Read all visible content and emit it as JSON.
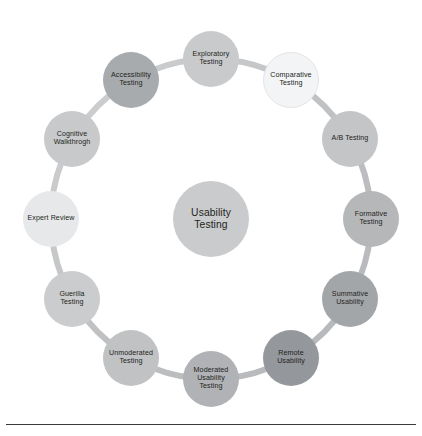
{
  "diagram": {
    "type": "circular-hub-and-spoke",
    "hub": {
      "label": "Usability\nTesting",
      "text": "Usability Testing",
      "color": "#c9cbcd",
      "cx": 211,
      "cy": 219,
      "r": 38
    },
    "ring": {
      "color": "#c4c6c8",
      "stroke_width": 6,
      "cx": 211,
      "cy": 219,
      "r": 160
    },
    "nodes": [
      {
        "id": "exploratory-testing",
        "label": "Exploratory\nTesting",
        "text": "Exploratory Testing",
        "color": "#c8cacc",
        "angle_deg": -90,
        "cx": 211,
        "cy": 59
      },
      {
        "id": "comparative-testing",
        "label": "Comparative\nTesting",
        "text": "Comparative Testing",
        "color": "#f2f4f6",
        "angle_deg": -60,
        "cx": 291,
        "cy": 80
      },
      {
        "id": "ab-testing",
        "label": "A/B Testing",
        "text": "A/B Testing",
        "color": "#c3c5c7",
        "angle_deg": -30,
        "cx": 350,
        "cy": 139
      },
      {
        "id": "formative-testing",
        "label": "Formative\nTesting",
        "text": "Formative Testing",
        "color": "#b5b7b9",
        "angle_deg": 0,
        "cx": 371,
        "cy": 219
      },
      {
        "id": "summative-usability",
        "label": "Summative\nUsability",
        "text": "Summative Usability",
        "color": "#a3a6a9",
        "angle_deg": 30,
        "cx": 350,
        "cy": 299
      },
      {
        "id": "remote-usability",
        "label": "Remote\nUsability",
        "text": "Remote Usability",
        "color": "#94979b",
        "angle_deg": 60,
        "cx": 291,
        "cy": 358
      },
      {
        "id": "moderated-usability-testing",
        "label": "Moderated\nUsability\nTesting",
        "text": "Moderated Usability Testing",
        "color": "#b0b2b5",
        "angle_deg": 90,
        "cx": 211,
        "cy": 379
      },
      {
        "id": "unmoderated-testing",
        "label": "Unmoderated\nTesting",
        "text": "Unmoderated Testing",
        "color": "#c0c2c4",
        "angle_deg": 120,
        "cx": 131,
        "cy": 358
      },
      {
        "id": "guerilla-testing",
        "label": "Guerilla\nTesting",
        "text": "Guerilla Testing",
        "color": "#cacccd",
        "angle_deg": 150,
        "cx": 72,
        "cy": 299
      },
      {
        "id": "expert-review",
        "label": "Expert Review",
        "text": "Expert Review",
        "color": "#e6e8ea",
        "angle_deg": 180,
        "cx": 51,
        "cy": 219
      },
      {
        "id": "cognitive-walkthrogh",
        "label": "Cognitive\nWalkthrogh",
        "text": "Cognitive Walkthrogh",
        "color": "#c7c9cb",
        "angle_deg": 210,
        "cx": 72,
        "cy": 139
      },
      {
        "id": "accessibility-testing",
        "label": "Accessibility\nTesting",
        "text": "Accessibility Testing",
        "color": "#a8abae",
        "angle_deg": 240,
        "cx": 131,
        "cy": 80
      }
    ],
    "footer": {
      "rule_color": "#3a3a3a"
    }
  }
}
